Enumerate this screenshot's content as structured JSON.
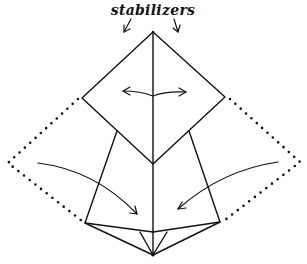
{
  "diagram": {
    "type": "origami-fold-diagram",
    "annotation": {
      "label": "stabilizers"
    },
    "colors": {
      "background": "#ffffff",
      "ink": "#111111"
    },
    "elements": [
      {
        "name": "top-diamond-flap",
        "description": "diamond flap with two-way spreading arrow"
      },
      {
        "name": "left-flap",
        "description": "quadrilateral flap"
      },
      {
        "name": "right-flap",
        "description": "quadrilateral flap"
      },
      {
        "name": "left-dotted-outline",
        "description": "dotted outline of unfolded left flap"
      },
      {
        "name": "right-dotted-outline",
        "description": "dotted outline of unfolded right flap"
      },
      {
        "name": "left-fold-arrow",
        "description": "curved arrow folding left flap inward"
      },
      {
        "name": "right-fold-arrow",
        "description": "curved arrow folding right flap inward"
      },
      {
        "name": "stabilizer-arrows",
        "description": "two small arrows pointing down to top apex"
      }
    ]
  }
}
